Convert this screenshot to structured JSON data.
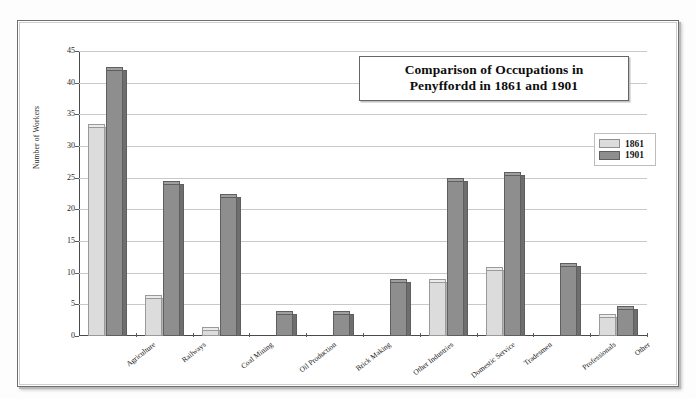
{
  "chart_data": {
    "type": "bar",
    "title": "Comparison of Occupations in Penyffordd in 1861 and 1901",
    "title_line1": "Comparison of Occupations in",
    "title_line2": "Penyffordd in 1861 and 1901",
    "xlabel": "",
    "ylabel": "Number of Workers",
    "ylim": [
      0,
      45
    ],
    "ytick_step": 5,
    "yticks": [
      0,
      5,
      10,
      15,
      20,
      25,
      30,
      35,
      40,
      45
    ],
    "grid": true,
    "legend_position": "top-right",
    "categories": [
      "Agriculture",
      "Railways",
      "Coal Mining",
      "Oil Production",
      "Brick Making",
      "Other Industries",
      "Domestic Service",
      "Tradesmen",
      "Professionals",
      "Other"
    ],
    "series": [
      {
        "name": "1861",
        "color": "#dcdcdc",
        "values": [
          33,
          6,
          1,
          0,
          0,
          0,
          8.5,
          10.5,
          0,
          3
        ]
      },
      {
        "name": "1901",
        "color": "#8e8e8e",
        "values": [
          42,
          24,
          22,
          3.5,
          3.5,
          8.5,
          24.5,
          25.5,
          11,
          4.3
        ]
      }
    ]
  },
  "legend": {
    "items": [
      {
        "label": "1861",
        "color": "#dcdcdc"
      },
      {
        "label": "1901",
        "color": "#8e8e8e"
      }
    ]
  }
}
